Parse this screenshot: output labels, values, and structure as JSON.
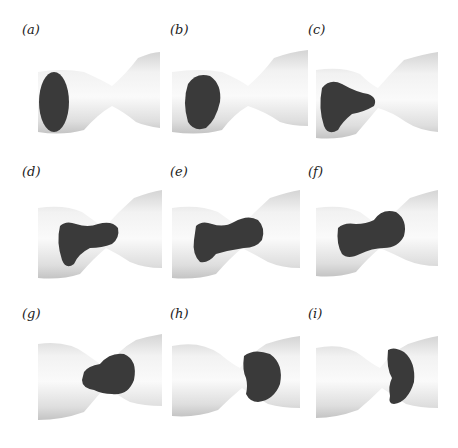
{
  "figure": {
    "panels": [
      {
        "label": "(a)"
      },
      {
        "label": "(b)"
      },
      {
        "label": "(c)"
      },
      {
        "label": "(d)"
      },
      {
        "label": "(e)"
      },
      {
        "label": "(f)"
      },
      {
        "label": "(g)"
      },
      {
        "label": "(h)"
      },
      {
        "label": "(i)"
      }
    ],
    "colors": {
      "tube": "#e6e6e6",
      "tube_shade": "#c8c8c8",
      "droplet": "#3a3a3a"
    }
  }
}
